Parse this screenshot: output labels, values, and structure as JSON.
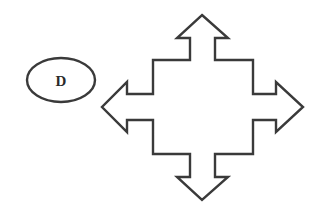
{
  "diagram": {
    "ellipse_node": {
      "label": "D",
      "shape": "ellipse"
    },
    "arrow_shape": {
      "type": "four-way-arrow",
      "directions": [
        "up",
        "right",
        "down",
        "left"
      ]
    },
    "colors": {
      "stroke": "#3a3a3a",
      "fill": "#ffffff",
      "background": "#ffffff"
    }
  }
}
